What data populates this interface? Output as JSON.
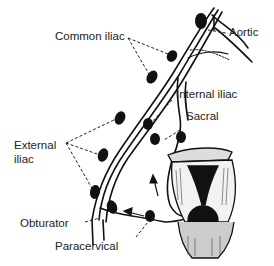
{
  "diagram": {
    "labels": {
      "aortic": "Aortic",
      "common_iliac": "Common iliac",
      "internal_iliac": "Internal iliac",
      "sacral": "Sacral",
      "external_iliac_line1": "External",
      "external_iliac_line2": "iliac",
      "obturator": "Obturator",
      "paracervical": "Paracervical"
    },
    "colors": {
      "ink": "#111111",
      "background": "#ffffff"
    }
  }
}
